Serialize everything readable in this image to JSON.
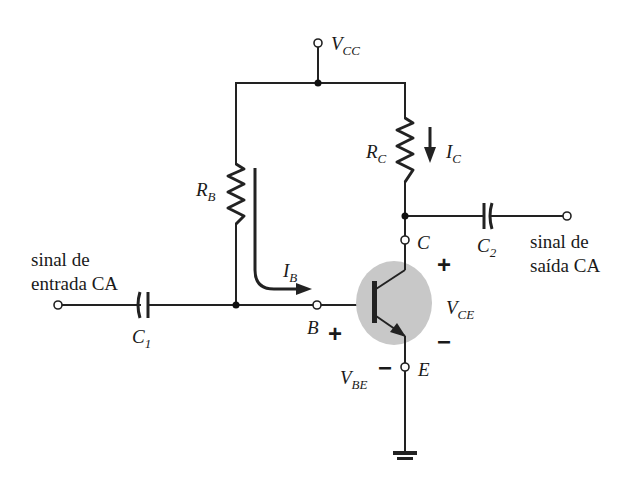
{
  "diagram": {
    "type": "common-emitter BJT amplifier (fixed-bias)",
    "colors": {
      "wire": "#222222",
      "transistor_fill": "#c8c8c8",
      "background": "#ffffff"
    },
    "supply": {
      "label_main": "V",
      "label_sub": "CC"
    },
    "resistors": [
      {
        "id": "rb",
        "label_main": "R",
        "label_sub": "B"
      },
      {
        "id": "rc",
        "label_main": "R",
        "label_sub": "C"
      }
    ],
    "capacitors": [
      {
        "id": "c1",
        "label_main": "C",
        "label_sub": "1"
      },
      {
        "id": "c2",
        "label_main": "C",
        "label_sub": "2"
      }
    ],
    "currents": [
      {
        "id": "ib",
        "label_main": "I",
        "label_sub": "B"
      },
      {
        "id": "ic",
        "label_main": "I",
        "label_sub": "C"
      }
    ],
    "voltages": [
      {
        "id": "vce",
        "label_main": "V",
        "label_sub": "CE",
        "plus": "+",
        "minus": "−"
      },
      {
        "id": "vbe",
        "label_main": "V",
        "label_sub": "BE",
        "plus": "+",
        "minus": "−"
      }
    ],
    "terminals": {
      "base": "B",
      "collector": "C",
      "emitter": "E"
    },
    "input": {
      "line1": "sinal de",
      "line2": "entrada CA"
    },
    "output": {
      "line1": "sinal de",
      "line2": "saída CA"
    }
  }
}
